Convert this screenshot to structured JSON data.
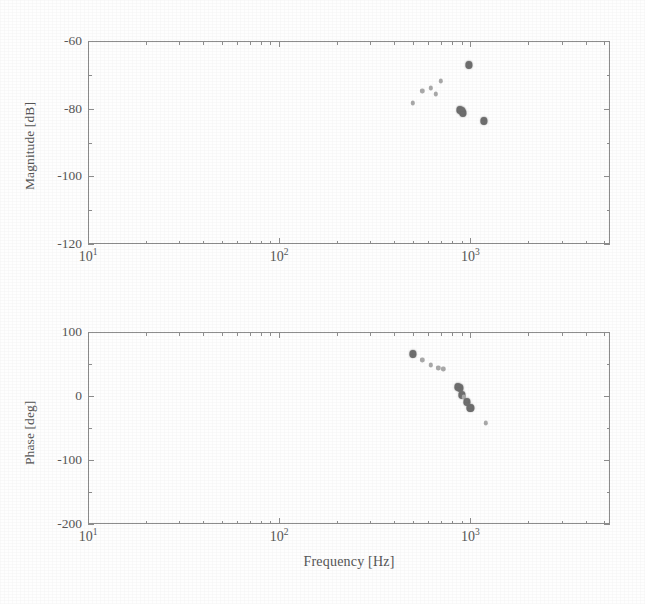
{
  "figure": {
    "background_color": "#fefefe",
    "ink_color": "#7d7d7d",
    "axis_color": "#8d8d8d"
  },
  "chart_data": [
    {
      "type": "scatter",
      "title": "",
      "subplot_index": 1,
      "name": "magnitude-plot",
      "xlabel": "",
      "ylabel": "Magnitude [dB]",
      "xscale": "log",
      "yscale": "linear",
      "xlim": [
        10,
        5370
      ],
      "ylim": [
        -120,
        -60
      ],
      "ytick_values": [
        -60,
        -80,
        -100,
        -120
      ],
      "ytick_labels": [
        "-60",
        "-80",
        "-100",
        "-120"
      ],
      "xtick_values": [
        10,
        100,
        1000
      ],
      "xtick_labels": [
        "10",
        "10",
        "10"
      ],
      "xtick_exponents": [
        "1",
        "2",
        "3"
      ],
      "grid": false,
      "legend": null,
      "x": [
        500,
        560,
        620,
        660,
        700,
        880,
        900,
        915,
        985,
        1180
      ],
      "y": [
        -78.3,
        -74.8,
        -73.9,
        -75.6,
        -71.9,
        -80.4,
        -80.8,
        -81.2,
        -67.2,
        -83.6
      ],
      "marker_sizes": [
        "small",
        "small",
        "small",
        "small",
        "small",
        "big",
        "big",
        "big",
        "big",
        "big"
      ]
    },
    {
      "type": "scatter",
      "title": "",
      "subplot_index": 2,
      "name": "phase-plot",
      "xlabel": "Frequency [Hz]",
      "ylabel": "Phase [deg]",
      "xscale": "log",
      "yscale": "linear",
      "xlim": [
        10,
        5370
      ],
      "ylim": [
        -200,
        100
      ],
      "ytick_values": [
        100,
        0,
        -100,
        -200
      ],
      "ytick_labels": [
        "100",
        "0",
        "-100",
        "-200"
      ],
      "xtick_values": [
        10,
        100,
        1000
      ],
      "xtick_labels": [
        "10",
        "10",
        "10"
      ],
      "xtick_exponents": [
        "1",
        "2",
        "3"
      ],
      "grid": false,
      "legend": null,
      "x": [
        500,
        560,
        620,
        680,
        720,
        860,
        880,
        905,
        925,
        960,
        1000,
        1200
      ],
      "y": [
        65,
        56,
        49,
        44,
        42,
        14,
        12,
        1,
        -2,
        -10,
        -18,
        -42
      ],
      "marker_sizes": [
        "big",
        "small",
        "small",
        "small",
        "small",
        "big",
        "big",
        "big",
        "small",
        "big",
        "big",
        "small"
      ]
    }
  ]
}
